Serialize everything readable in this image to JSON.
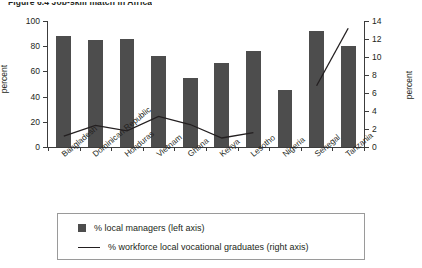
{
  "figure": {
    "title": "Figure 6.4   Job-skill match in Africa"
  },
  "axes": {
    "left": {
      "label": "percent",
      "ticks": [
        0,
        20,
        40,
        60,
        80,
        100
      ],
      "min": 0,
      "max": 100
    },
    "right": {
      "label": "percent",
      "ticks": [
        0,
        2,
        4,
        6,
        8,
        10,
        12,
        14
      ],
      "min": 0,
      "max": 14
    }
  },
  "legend": {
    "items": [
      {
        "marker": "square",
        "label": "% local managers (left axis)"
      },
      {
        "marker": "line",
        "label": "% workforce local vocational graduates (right axis)"
      }
    ]
  },
  "colors": {
    "bar": "#4d4d4d",
    "line": "#231f20",
    "axis": "#3c3c3c",
    "text": "#231f20",
    "background": "#ffffff",
    "legend_border": "#9a9a9a"
  },
  "chart_data": {
    "type": "bar",
    "title": "Figure 6.4   Job-skill match in Africa",
    "xlabel": "",
    "ylabel": "percent",
    "ylim": [
      0,
      100
    ],
    "y2lim": [
      0,
      14
    ],
    "y2label": "percent",
    "grid": false,
    "legend_position": "bottom",
    "categories": [
      "Bangladesh",
      "Dominican Republic",
      "Honduras",
      "Vietnam",
      "Ghana",
      "Kenya",
      "Lesotho",
      "Nigeria",
      "Senegal",
      "Tanzania"
    ],
    "series": [
      {
        "name": "% local managers (left axis)",
        "type": "bar",
        "axis": "left",
        "values": [
          88,
          85,
          86,
          72,
          55,
          67,
          76,
          45,
          92,
          80
        ]
      },
      {
        "name": "% workforce local vocational graduates (right axis)",
        "type": "line",
        "axis": "right",
        "values": [
          1.2,
          2.4,
          1.8,
          3.4,
          2.5,
          1.0,
          1.6,
          null,
          6.8,
          13.2
        ]
      }
    ]
  }
}
